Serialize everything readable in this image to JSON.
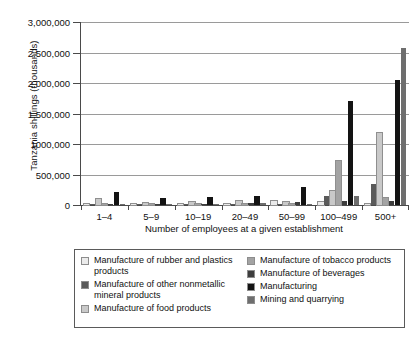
{
  "chart_data": {
    "type": "bar",
    "title": "",
    "subtitle": "",
    "xlabel": "Number of employees at a given establishment",
    "ylabel": "Tanzania shillings (thousands)",
    "grid": true,
    "legend_position": "bottom",
    "ylim": [
      0,
      3000000
    ],
    "ytick_values": [
      0,
      500000,
      1000000,
      1500000,
      2000000,
      2500000,
      3000000
    ],
    "ytick_labels": [
      "0",
      "500,000",
      "1000,000",
      "1,500,000",
      "2,000,000",
      "2,500,000",
      "3,000,000"
    ],
    "categories": [
      "1–4",
      "5–9",
      "10–19",
      "20–49",
      "50–99",
      "100–499",
      "500+"
    ],
    "series": [
      {
        "name": "Manufacture of rubber and plastics products",
        "color": "#ebebeb",
        "values": [
          3000,
          6000,
          8000,
          14000,
          62000,
          45000,
          20000
        ]
      },
      {
        "name": "Manufacture of other nonmetallic mineral products",
        "color": "#5a5a5a",
        "values": [
          5000,
          10000,
          12000,
          20000,
          12000,
          155000,
          350000
        ]
      },
      {
        "name": "Manufacture of food products",
        "color": "#c9c9c9",
        "values": [
          95000,
          40000,
          45000,
          70000,
          45000,
          230000,
          1180000
        ]
      },
      {
        "name": "Manufacture of tobacco products",
        "color": "#a3a3a3",
        "values": [
          4000,
          5000,
          6000,
          10000,
          10000,
          720000,
          115000
        ]
      },
      {
        "name": "Manufacture of beverages",
        "color": "#3d3d3d",
        "values": [
          8000,
          12000,
          14000,
          30000,
          55000,
          60000,
          60000
        ]
      },
      {
        "name": "Manufacturing",
        "color": "#131313",
        "values": [
          210000,
          115000,
          125000,
          145000,
          290000,
          1705000,
          2055000
        ]
      },
      {
        "name": "Mining and quarrying",
        "color": "#6e6e6e",
        "values": [
          5000,
          8000,
          12000,
          25000,
          12000,
          140000,
          2580000
        ]
      }
    ]
  },
  "legend": {
    "columns": [
      {
        "items": [
          {
            "label": "Manufacture of rubber and plastics products",
            "color": "#ebebeb"
          },
          {
            "label": "Manufacture of other nonmetallic mineral products",
            "color": "#5a5a5a"
          },
          {
            "label": "Manufacture of food products",
            "color": "#c9c9c9"
          }
        ]
      },
      {
        "items": [
          {
            "label": "Manufacture of tobacco products",
            "color": "#a3a3a3"
          },
          {
            "label": "Manufacture of beverages",
            "color": "#3d3d3d"
          },
          {
            "label": "Manufacturing",
            "color": "#131313"
          },
          {
            "label": "Mining and quarrying",
            "color": "#6e6e6e"
          }
        ]
      }
    ]
  }
}
